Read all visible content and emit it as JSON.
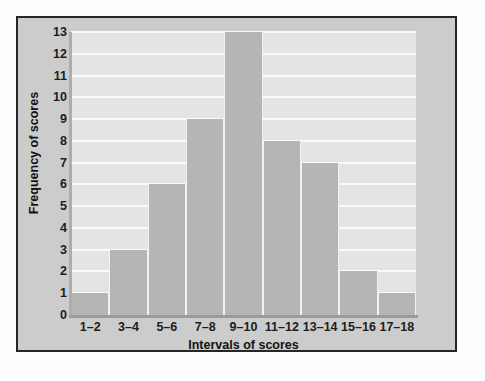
{
  "chart_data": {
    "type": "bar",
    "title": "",
    "subtitle": "",
    "xlabel": "Intervals of scores",
    "ylabel": "Frequency of scores",
    "categories": [
      "1–2",
      "3–4",
      "5–6",
      "7–8",
      "9–10",
      "11–12",
      "13–14",
      "15–16",
      "17–18"
    ],
    "values": [
      1,
      3,
      6,
      9,
      13,
      8,
      7,
      2,
      1
    ],
    "ylim": [
      0,
      13
    ],
    "ytick_labels": [
      "0",
      "1",
      "2",
      "3",
      "4",
      "5",
      "6",
      "7",
      "8",
      "9",
      "10",
      "11",
      "12",
      "13"
    ],
    "ytick_values": [
      0,
      1,
      2,
      3,
      4,
      5,
      6,
      7,
      8,
      9,
      10,
      11,
      12,
      13
    ],
    "grid": true,
    "grid_axis": "y",
    "legend": false,
    "legend_position": "none",
    "bar_gap": "contiguous",
    "colors": {
      "bar_fill": "#b5b5b5",
      "plot_background": "#e4e4e4",
      "panel_background": "#cccccc",
      "gridline": "#fafafa",
      "axis_line": "#9b9b9b",
      "frame_border": "#262626",
      "text": "#131313",
      "page_background": "#fdfdfd"
    }
  }
}
